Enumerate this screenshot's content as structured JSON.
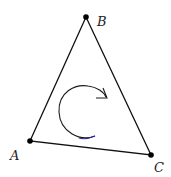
{
  "diagram": {
    "type": "triangle-orientation",
    "vertices": [
      {
        "label": "A",
        "x": 30,
        "y": 141,
        "label_x": 10,
        "label_y": 160
      },
      {
        "label": "B",
        "x": 86,
        "y": 17,
        "label_x": 97,
        "label_y": 26
      },
      {
        "label": "C",
        "x": 151,
        "y": 155,
        "label_x": 154,
        "label_y": 172
      }
    ],
    "rotation_arrow": {
      "direction": "clockwise",
      "color": "#1a1a1a",
      "accent_color": "#2a2aa0"
    },
    "stroke_color": "#111111"
  }
}
